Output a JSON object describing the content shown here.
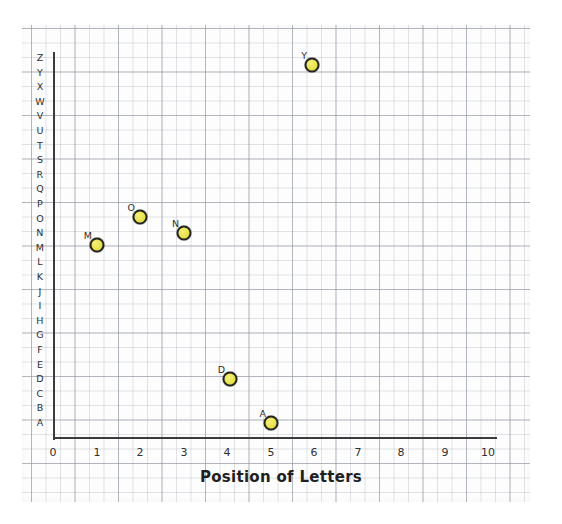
{
  "paper": {
    "background_color": "#fdfdfd",
    "grid_fine_color": "#afb4be",
    "grid_heavy_color": "#8c919b"
  },
  "axes": {
    "color": "#3b3b3b",
    "origin_label": "0",
    "x_title": "Position of Letters",
    "x_ticks": [
      "0",
      "1",
      "2",
      "3",
      "4",
      "5",
      "6",
      "7",
      "8",
      "9",
      "10"
    ],
    "y_ticks": [
      "A",
      "B",
      "C",
      "D",
      "E",
      "F",
      "G",
      "H",
      "I",
      "J",
      "K",
      "L",
      "M",
      "N",
      "O",
      "P",
      "Q",
      "R",
      "S",
      "T",
      "U",
      "V",
      "W",
      "X",
      "Y",
      "Z"
    ]
  },
  "marker": {
    "fill_color": "#e9e44c",
    "outline_color": "#23231a"
  },
  "chart_data": {
    "type": "scatter",
    "title": "",
    "xlabel": "Position of Letters",
    "ylabel": "",
    "xlim": [
      0,
      10
    ],
    "ylim": [
      "A",
      "Z"
    ],
    "grid": true,
    "legend": "none",
    "x": [
      1,
      2,
      3,
      4,
      5,
      6
    ],
    "y": [
      "M",
      "O",
      "N",
      "D",
      "A",
      "Y"
    ],
    "labels": [
      "M",
      "O",
      "N",
      "D",
      "A",
      "Y"
    ],
    "points": [
      {
        "label": "M",
        "x": 1,
        "y": "M",
        "px": 97,
        "py": 245
      },
      {
        "label": "O",
        "x": 2,
        "y": "O",
        "px": 140,
        "py": 217
      },
      {
        "label": "N",
        "x": 3,
        "y": "N",
        "px": 184,
        "py": 233
      },
      {
        "label": "D",
        "x": 4,
        "y": "D",
        "px": 230,
        "py": 379
      },
      {
        "label": "A",
        "x": 5,
        "y": "A",
        "px": 271,
        "py": 423
      },
      {
        "label": "Y",
        "x": 6,
        "y": "Y",
        "px": 312,
        "py": 65
      }
    ],
    "x_tick_positions_px": [
      53,
      97,
      140,
      184,
      227,
      271,
      314,
      358,
      401,
      445,
      488
    ],
    "y_tick_base_px": 423,
    "y_tick_step_px": 14.6
  }
}
